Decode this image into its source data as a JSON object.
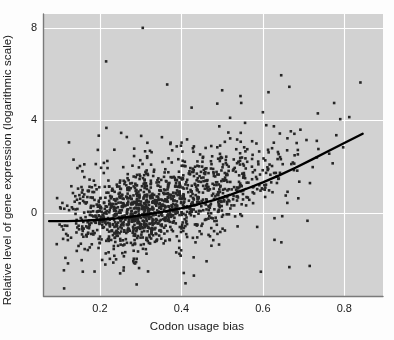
{
  "chart_data": {
    "type": "scatter",
    "title": "",
    "xlabel": "Codon usage bias",
    "ylabel": "Relative level of gene expression (logarithmic scale)",
    "xlim": [
      0.06,
      0.895
    ],
    "ylim": [
      -3.6,
      8.6
    ],
    "xticks": [
      0.2,
      0.4,
      0.6,
      0.8
    ],
    "xtick_labels": [
      "0.2",
      "0.4",
      "0.6",
      "0.8"
    ],
    "yticks": [
      0,
      4,
      8
    ],
    "ytick_labels": [
      "0",
      "4",
      "8"
    ],
    "grid": true,
    "grid_color": "#ffffff",
    "panel_color": "#d2d2d2",
    "figure_color": "#fdfdfd",
    "point_color": "#262626",
    "point_size": 2.6,
    "n_points": 1450,
    "legend": "none",
    "series": [
      {
        "name": "genes",
        "description": "Dense cloud of individual genes; codon usage bias versus log relative expression. Bulk of mass between x 0.2 and 0.5 with y centred near 0, spreading upward and rightward.",
        "x_mode": 0.33,
        "y_mode": -0.1,
        "x_spread": 0.105,
        "y_spread": 1.05,
        "correlation": 0.42
      }
    ],
    "trend_line": {
      "name": "loess fit",
      "color": "#000000",
      "width": 2.4,
      "x_start": 0.075,
      "x_end": 0.845,
      "points": [
        [
          0.075,
          -0.36
        ],
        [
          0.12,
          -0.36
        ],
        [
          0.16,
          -0.34
        ],
        [
          0.2,
          -0.3
        ],
        [
          0.24,
          -0.24
        ],
        [
          0.28,
          -0.16
        ],
        [
          0.32,
          -0.06
        ],
        [
          0.36,
          0.06
        ],
        [
          0.4,
          0.2
        ],
        [
          0.44,
          0.36
        ],
        [
          0.48,
          0.55
        ],
        [
          0.52,
          0.78
        ],
        [
          0.56,
          1.04
        ],
        [
          0.6,
          1.32
        ],
        [
          0.64,
          1.62
        ],
        [
          0.68,
          1.95
        ],
        [
          0.72,
          2.3
        ],
        [
          0.76,
          2.66
        ],
        [
          0.8,
          3.02
        ],
        [
          0.845,
          3.42
        ]
      ]
    },
    "annotations": []
  },
  "axes": {
    "x_title": "Codon usage bias",
    "y_title": "Relative level of gene expression (logarithmic scale)"
  }
}
